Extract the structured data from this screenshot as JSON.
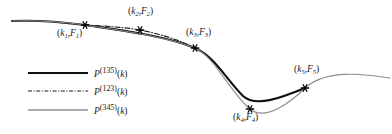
{
  "figure": {
    "type": "line-plot",
    "background": "#ffffff"
  },
  "chart_data": {
    "type": "line",
    "title": "",
    "xlabel": "",
    "ylabel": "",
    "grid": false,
    "legend_position": "lower-left",
    "axis_shown": false,
    "xlim": [
      0,
      392
    ],
    "ylim": [
      134,
      0
    ],
    "points": [
      {
        "id": "p1",
        "label": "(k1,F1)",
        "k": "k",
        "k_sub": "1",
        "F": "F",
        "F_sub": "1",
        "x": 85,
        "y": 25,
        "label_x": 57,
        "label_y": 28
      },
      {
        "id": "p2",
        "label": "(k2,F2)",
        "k": "k",
        "k_sub": "2",
        "F": "F",
        "F_sub": "2",
        "x": 140,
        "y": 30,
        "label_x": 128,
        "label_y": 6
      },
      {
        "id": "p3",
        "label": "(k3,F3)",
        "k": "k",
        "k_sub": "3",
        "F": "F",
        "F_sub": "3",
        "x": 195,
        "y": 48,
        "label_x": 186,
        "label_y": 27
      },
      {
        "id": "p4",
        "label": "(k4,F4)",
        "k": "k",
        "k_sub": "4",
        "F": "F",
        "F_sub": "4",
        "x": 250,
        "y": 109,
        "label_x": 233,
        "label_y": 112
      },
      {
        "id": "p5",
        "label": "(k5,F5)",
        "k": "k",
        "k_sub": "5",
        "F": "F",
        "F_sub": "5",
        "x": 305,
        "y": 88,
        "label_x": 294,
        "label_y": 64
      }
    ],
    "series": [
      {
        "name": "P^(135)(k)",
        "base": "P",
        "superscript": "(135)",
        "argument": "(k)",
        "style": "solid",
        "color": "#111111",
        "width": 2.1,
        "through_points": [
          "p1",
          "p3",
          "p5"
        ],
        "path": "M 12,21 C 35,20 62,22 85,25 C 112,29 163,35 195,48 C 214,56 226,79 243,96 C 256,108 283,97 305,88"
      },
      {
        "name": "P^(123)(k)",
        "base": "P",
        "superscript": "(123)",
        "argument": "(k)",
        "style": "dash-dot",
        "color": "#1b1b1b",
        "width": 1.1,
        "dash_pattern": "5,2,1,2",
        "through_points": [
          "p1",
          "p2",
          "p3"
        ],
        "path": "M 85,25 C 104,26 122,27 140,30 C 160,34 180,40 195,48"
      },
      {
        "name": "P^(345)(k)",
        "base": "P",
        "superscript": "(345)",
        "argument": "(k)",
        "style": "solid",
        "color": "#8c8c8c",
        "width": 1.1,
        "through_points": [
          "p3",
          "p4",
          "p5"
        ],
        "path": "M 12,21 C 42,20 62,22 85,25 C 116,30 165,36 195,48 C 214,56 230,92 250,109 C 266,122 292,101 305,88 C 325,70 360,73 390,78"
      }
    ],
    "legend": {
      "entries": [
        {
          "label_base": "P",
          "label_sup": "(135)",
          "label_arg": "(k)",
          "style": "solid",
          "color": "#111111",
          "width": 2.1,
          "y": 73,
          "x1": 28,
          "x2": 88
        },
        {
          "label_base": "P",
          "label_sup": "(123)",
          "label_arg": "(k)",
          "style": "dash-dot",
          "color": "#1b1b1b",
          "width": 1.1,
          "y": 91,
          "x1": 28,
          "x2": 88
        },
        {
          "label_base": "P",
          "label_sup": "(345)",
          "label_arg": "(k)",
          "style": "solid",
          "color": "#8c8c8c",
          "width": 1.3,
          "y": 110,
          "x1": 28,
          "x2": 88
        }
      ],
      "text_x": 94
    },
    "marker": {
      "shape": "asterisk",
      "color": "#000000",
      "size": 5
    }
  }
}
